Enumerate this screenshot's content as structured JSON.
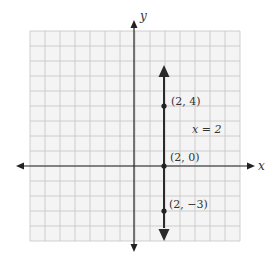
{
  "chart_data": {
    "type": "line",
    "title": "",
    "xlabel": "x",
    "ylabel": "y",
    "xlim": [
      -7,
      7
    ],
    "ylim": [
      -5,
      9
    ],
    "grid": true,
    "grid_step": 1,
    "line": {
      "equation": "x = 2",
      "type": "vertical",
      "x": 2,
      "arrows": "both"
    },
    "points": [
      {
        "x": 2,
        "y": 4,
        "label": "(2, 4)"
      },
      {
        "x": 2,
        "y": 0,
        "label": "(2, 0)"
      },
      {
        "x": 2,
        "y": -3,
        "label": "(2, −3)"
      }
    ]
  },
  "labels": {
    "x_axis": "x",
    "y_axis": "y",
    "equation": "x = 2",
    "point_a": "(2, 4)",
    "point_b": "(2, 0)",
    "point_c": "(2, −3)"
  },
  "colors": {
    "grid": "#c4c4c4",
    "grid_bg": "#f4f4f4",
    "axis": "#222222",
    "line": "#2a2a2a"
  }
}
